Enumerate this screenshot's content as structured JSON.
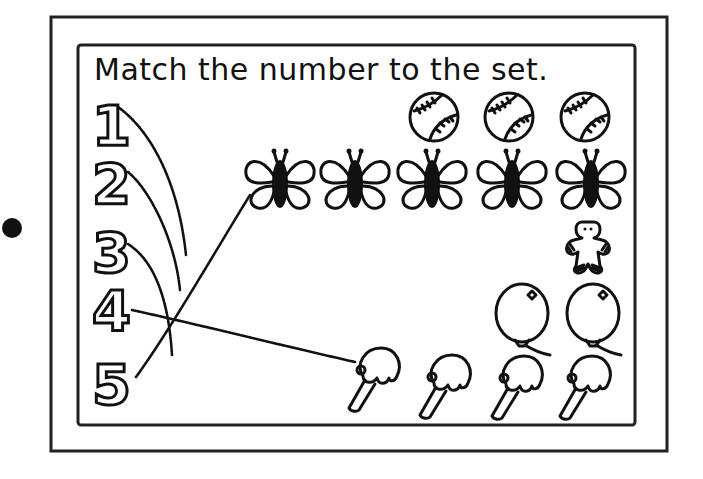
{
  "worksheet": {
    "title": "Match the number to the set.",
    "numbers": [
      "1",
      "2",
      "3",
      "4",
      "5"
    ],
    "sets": [
      {
        "item": "baseball",
        "count": 3
      },
      {
        "item": "butterfly",
        "count": 5
      },
      {
        "item": "gingerbread-man",
        "count": 1
      },
      {
        "item": "balloon",
        "count": 2
      },
      {
        "item": "ice-cream-cone",
        "count": 4
      }
    ],
    "drawn_lines": [
      {
        "from_number": "1",
        "to": "unconnected"
      },
      {
        "from_number": "2",
        "to": "unconnected"
      },
      {
        "from_number": "3",
        "to": "unconnected"
      },
      {
        "from_number": "4",
        "to": "ice-cream-cone"
      },
      {
        "from_number": "5",
        "to": "butterfly"
      }
    ]
  },
  "colors": {
    "ink": "#111111",
    "paper": "#ffffff"
  }
}
